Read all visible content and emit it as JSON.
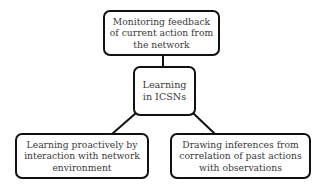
{
  "diagram": {
    "type": "hierarchy",
    "colors": {
      "border": "#111111",
      "text": "#3a3a3a",
      "background": "#ffffff"
    },
    "nodes": {
      "top": {
        "lines": [
          "Monitoring feedback",
          "of current action from",
          "the network"
        ]
      },
      "center": {
        "lines": [
          "Learning",
          "in ICSNs"
        ]
      },
      "left": {
        "lines": [
          "Learning proactively by",
          "interaction with network",
          "environment"
        ]
      },
      "right": {
        "lines": [
          "Drawing inferences from",
          "correlation of past actions",
          "with observations"
        ]
      }
    },
    "edges": [
      {
        "from": "center",
        "to": "top"
      },
      {
        "from": "center",
        "to": "left"
      },
      {
        "from": "center",
        "to": "right"
      }
    ]
  }
}
